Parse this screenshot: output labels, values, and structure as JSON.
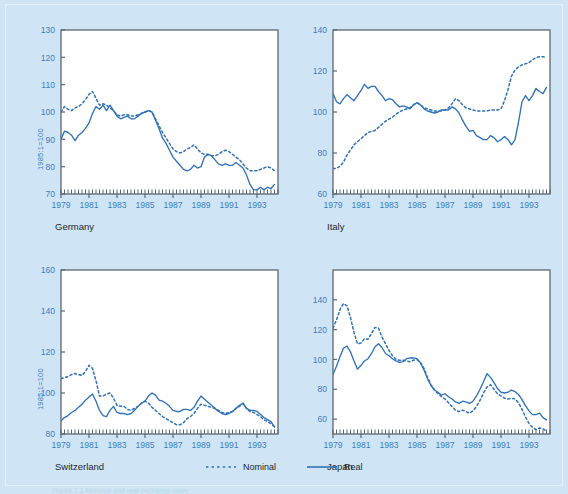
{
  "figure": {
    "background_color": "#cfe5f5",
    "axis_color": "#5b6770",
    "tick_label_color": "#3a7fc1",
    "series_color": "#2f72b8",
    "title_color": "#23272b",
    "caption": "Figure 7.1  Nominal and real exchange rates"
  },
  "legend": {
    "position": "bottom-center",
    "entries": [
      {
        "label": "Nominal",
        "style": "dotted"
      },
      {
        "label": "Real",
        "style": "solid"
      }
    ]
  },
  "chart_data": [
    {
      "type": "line",
      "title": "Germany",
      "xlabel": "",
      "ylabel": "1985:1=100",
      "xlim": [
        1979.0,
        1994.5
      ],
      "ylim": [
        70,
        130
      ],
      "yticks": [
        70,
        80,
        90,
        100,
        110,
        120,
        130
      ],
      "xticks": [
        1979,
        1981,
        1983,
        1985,
        1987,
        1989,
        1991,
        1993
      ],
      "grid": false,
      "x": [
        1979.0,
        1979.25,
        1979.5,
        1979.75,
        1980.0,
        1980.25,
        1980.5,
        1980.75,
        1981.0,
        1981.25,
        1981.5,
        1981.75,
        1982.0,
        1982.25,
        1982.5,
        1982.75,
        1983.0,
        1983.25,
        1983.5,
        1983.75,
        1984.0,
        1984.25,
        1984.5,
        1984.75,
        1985.0,
        1985.25,
        1985.5,
        1985.75,
        1986.0,
        1986.25,
        1986.5,
        1986.75,
        1987.0,
        1987.25,
        1987.5,
        1987.75,
        1988.0,
        1988.25,
        1988.5,
        1988.75,
        1989.0,
        1989.25,
        1989.5,
        1989.75,
        1990.0,
        1990.25,
        1990.5,
        1990.75,
        1991.0,
        1991.25,
        1991.5,
        1991.75,
        1992.0,
        1992.25,
        1992.5,
        1992.75,
        1993.0,
        1993.25,
        1993.5,
        1993.75,
        1994.0,
        1994.25
      ],
      "series": [
        {
          "name": "Nominal",
          "style": "dotted",
          "values": [
            100.0,
            102.0,
            101.0,
            100.5,
            101.5,
            102.0,
            103.0,
            104.5,
            106.5,
            107.5,
            105.0,
            102.5,
            103.0,
            102.5,
            101.5,
            100.5,
            99.0,
            98.5,
            99.0,
            99.0,
            98.5,
            98.5,
            99.0,
            99.5,
            100.0,
            100.5,
            100.0,
            97.5,
            95.0,
            92.5,
            90.5,
            88.5,
            86.5,
            85.5,
            85.0,
            85.5,
            86.5,
            87.0,
            88.0,
            86.5,
            85.0,
            84.5,
            84.5,
            84.0,
            84.0,
            84.5,
            85.5,
            86.0,
            85.5,
            84.5,
            83.5,
            82.5,
            81.0,
            79.5,
            78.5,
            78.5,
            78.5,
            79.0,
            79.5,
            80.0,
            79.5,
            78.5
          ]
        },
        {
          "name": "Real",
          "style": "solid",
          "values": [
            90.0,
            93.0,
            92.5,
            91.5,
            89.5,
            91.5,
            92.5,
            94.0,
            96.0,
            99.5,
            102.0,
            101.0,
            102.5,
            100.5,
            102.5,
            100.5,
            98.5,
            97.5,
            98.0,
            98.5,
            97.5,
            97.5,
            98.5,
            99.5,
            100.0,
            100.5,
            100.0,
            97.0,
            94.0,
            90.5,
            88.5,
            86.0,
            83.5,
            82.0,
            80.5,
            79.0,
            78.5,
            79.0,
            80.5,
            79.5,
            80.0,
            83.5,
            84.5,
            84.0,
            82.5,
            81.0,
            80.5,
            81.0,
            80.5,
            80.5,
            81.5,
            80.5,
            79.5,
            77.0,
            73.5,
            71.5,
            71.5,
            72.5,
            71.5,
            72.5,
            72.0,
            73.5
          ]
        }
      ]
    },
    {
      "type": "line",
      "title": "Italy",
      "xlabel": "",
      "ylabel": "",
      "xlim": [
        1979.0,
        1994.5
      ],
      "ylim": [
        60,
        140
      ],
      "yticks": [
        60,
        80,
        100,
        120,
        140
      ],
      "xticks": [
        1979,
        1981,
        1983,
        1985,
        1987,
        1989,
        1991,
        1993
      ],
      "grid": false,
      "x": [
        1979.0,
        1979.25,
        1979.5,
        1979.75,
        1980.0,
        1980.25,
        1980.5,
        1980.75,
        1981.0,
        1981.25,
        1981.5,
        1981.75,
        1982.0,
        1982.25,
        1982.5,
        1982.75,
        1983.0,
        1983.25,
        1983.5,
        1983.75,
        1984.0,
        1984.25,
        1984.5,
        1984.75,
        1985.0,
        1985.25,
        1985.5,
        1985.75,
        1986.0,
        1986.25,
        1986.5,
        1986.75,
        1987.0,
        1987.25,
        1987.5,
        1987.75,
        1988.0,
        1988.25,
        1988.5,
        1988.75,
        1989.0,
        1989.25,
        1989.5,
        1989.75,
        1990.0,
        1990.25,
        1990.5,
        1990.75,
        1991.0,
        1991.25,
        1991.5,
        1991.75,
        1992.0,
        1992.25,
        1992.5,
        1992.75,
        1993.0,
        1993.25,
        1993.5,
        1993.75,
        1994.0,
        1994.25
      ],
      "series": [
        {
          "name": "Nominal",
          "style": "dotted",
          "values": [
            72.5,
            72.5,
            73.5,
            75.5,
            79.0,
            81.5,
            84.0,
            85.5,
            87.0,
            88.5,
            90.0,
            90.5,
            91.0,
            92.5,
            94.0,
            95.5,
            96.5,
            97.5,
            99.0,
            100.0,
            101.0,
            101.5,
            102.0,
            103.5,
            104.5,
            103.5,
            102.0,
            101.5,
            101.0,
            100.5,
            100.5,
            100.5,
            101.0,
            102.0,
            104.0,
            106.5,
            105.5,
            103.5,
            102.0,
            101.5,
            101.0,
            100.5,
            100.5,
            100.5,
            100.5,
            101.0,
            101.0,
            101.0,
            101.5,
            105.5,
            111.0,
            117.5,
            120.5,
            122.0,
            123.0,
            123.5,
            124.0,
            125.5,
            126.5,
            127.0,
            127.0,
            126.5
          ]
        },
        {
          "name": "Real",
          "style": "solid",
          "values": [
            109.0,
            105.0,
            104.0,
            106.5,
            108.5,
            107.0,
            105.5,
            108.0,
            110.5,
            113.5,
            111.5,
            112.5,
            112.5,
            110.0,
            108.0,
            105.5,
            106.5,
            106.0,
            104.0,
            102.5,
            103.0,
            102.5,
            101.5,
            103.5,
            104.5,
            103.5,
            101.5,
            100.5,
            100.0,
            99.5,
            100.0,
            101.0,
            101.0,
            101.0,
            102.5,
            101.5,
            99.5,
            96.0,
            93.0,
            90.5,
            91.0,
            88.5,
            87.5,
            86.5,
            86.5,
            88.5,
            87.5,
            85.5,
            86.5,
            88.0,
            86.5,
            84.0,
            86.5,
            95.0,
            105.0,
            108.0,
            105.5,
            108.0,
            111.5,
            110.0,
            109.0,
            112.0
          ]
        }
      ]
    },
    {
      "type": "line",
      "title": "Switzerland",
      "xlabel": "",
      "ylabel": "1985:1=100",
      "xlim": [
        1979.0,
        1994.5
      ],
      "ylim": [
        80,
        160
      ],
      "yticks": [
        80,
        100,
        120,
        140,
        160
      ],
      "xticks": [
        1979,
        1981,
        1983,
        1985,
        1987,
        1989,
        1991,
        1993
      ],
      "grid": false,
      "x": [
        1979.0,
        1979.25,
        1979.5,
        1979.75,
        1980.0,
        1980.25,
        1980.5,
        1980.75,
        1981.0,
        1981.25,
        1981.5,
        1981.75,
        1982.0,
        1982.25,
        1982.5,
        1982.75,
        1983.0,
        1983.25,
        1983.5,
        1983.75,
        1984.0,
        1984.25,
        1984.5,
        1984.75,
        1985.0,
        1985.25,
        1985.5,
        1985.75,
        1986.0,
        1986.25,
        1986.5,
        1986.75,
        1987.0,
        1987.25,
        1987.5,
        1987.75,
        1988.0,
        1988.25,
        1988.5,
        1988.75,
        1989.0,
        1989.25,
        1989.5,
        1989.75,
        1990.0,
        1990.25,
        1990.5,
        1990.75,
        1991.0,
        1991.25,
        1991.5,
        1991.75,
        1992.0,
        1992.25,
        1992.5,
        1992.75,
        1993.0,
        1993.25,
        1993.5,
        1993.75,
        1994.0,
        1994.25
      ],
      "series": [
        {
          "name": "Nominal",
          "style": "dotted",
          "values": [
            107.0,
            107.5,
            108.0,
            109.0,
            109.5,
            109.0,
            108.5,
            110.5,
            113.5,
            112.0,
            106.0,
            98.5,
            98.5,
            99.5,
            100.0,
            97.5,
            94.0,
            93.5,
            93.5,
            92.0,
            91.5,
            92.5,
            93.5,
            95.0,
            96.0,
            95.0,
            93.0,
            91.5,
            90.0,
            88.5,
            87.5,
            86.5,
            85.5,
            84.5,
            84.5,
            85.5,
            87.5,
            88.5,
            90.0,
            92.5,
            94.5,
            94.0,
            93.5,
            93.0,
            92.5,
            91.5,
            90.5,
            90.0,
            90.5,
            91.0,
            92.5,
            93.5,
            95.0,
            92.5,
            91.0,
            90.5,
            89.5,
            88.5,
            87.0,
            86.0,
            85.0,
            83.5
          ]
        },
        {
          "name": "Real",
          "style": "solid",
          "values": [
            86.5,
            88.0,
            89.0,
            90.5,
            91.5,
            93.0,
            94.5,
            96.5,
            98.0,
            99.5,
            96.0,
            91.5,
            89.0,
            88.5,
            91.5,
            93.5,
            90.5,
            90.0,
            90.0,
            89.5,
            90.0,
            91.5,
            93.5,
            95.0,
            96.0,
            98.5,
            100.0,
            99.0,
            96.5,
            96.0,
            95.0,
            93.5,
            91.5,
            91.0,
            91.0,
            92.0,
            92.0,
            91.5,
            93.0,
            96.0,
            98.5,
            97.0,
            95.5,
            94.0,
            92.5,
            91.0,
            90.0,
            89.5,
            90.0,
            91.0,
            92.5,
            94.0,
            95.0,
            92.5,
            91.5,
            91.5,
            91.0,
            89.5,
            88.0,
            87.0,
            86.0,
            83.5
          ]
        }
      ]
    },
    {
      "type": "line",
      "title": "Japan",
      "xlabel": "",
      "ylabel": "",
      "xlim": [
        1979.0,
        1994.5
      ],
      "ylim": [
        50,
        160
      ],
      "yticks": [
        60,
        80,
        100,
        120,
        140
      ],
      "xticks": [
        1979,
        1981,
        1983,
        1985,
        1987,
        1989,
        1991,
        1993
      ],
      "grid": false,
      "x": [
        1979.0,
        1979.25,
        1979.5,
        1979.75,
        1980.0,
        1980.25,
        1980.5,
        1980.75,
        1981.0,
        1981.25,
        1981.5,
        1981.75,
        1982.0,
        1982.25,
        1982.5,
        1982.75,
        1983.0,
        1983.25,
        1983.5,
        1983.75,
        1984.0,
        1984.25,
        1984.5,
        1984.75,
        1985.0,
        1985.25,
        1985.5,
        1985.75,
        1986.0,
        1986.25,
        1986.5,
        1986.75,
        1987.0,
        1987.25,
        1987.5,
        1987.75,
        1988.0,
        1988.25,
        1988.5,
        1988.75,
        1989.0,
        1989.25,
        1989.5,
        1989.75,
        1990.0,
        1990.25,
        1990.5,
        1990.75,
        1991.0,
        1991.25,
        1991.5,
        1991.75,
        1992.0,
        1992.25,
        1992.5,
        1992.75,
        1993.0,
        1993.25,
        1993.5,
        1993.75,
        1994.0,
        1994.25
      ],
      "series": [
        {
          "name": "Nominal",
          "style": "dotted",
          "values": [
            121.0,
            126.5,
            133.5,
            137.5,
            136.0,
            128.0,
            118.0,
            110.5,
            111.0,
            114.0,
            113.5,
            117.5,
            121.5,
            121.0,
            115.0,
            110.5,
            106.0,
            102.5,
            100.0,
            99.5,
            99.5,
            99.0,
            98.5,
            99.5,
            100.0,
            98.0,
            94.0,
            88.0,
            83.0,
            79.5,
            77.0,
            75.0,
            73.5,
            71.0,
            68.5,
            66.0,
            65.0,
            66.0,
            65.0,
            64.0,
            65.5,
            68.5,
            72.5,
            77.5,
            81.5,
            83.0,
            80.0,
            77.0,
            75.5,
            74.0,
            73.5,
            74.0,
            73.5,
            71.0,
            66.5,
            61.5,
            57.0,
            54.5,
            53.0,
            54.0,
            53.5,
            52.0
          ]
        },
        {
          "name": "Real",
          "style": "solid",
          "values": [
            90.0,
            95.5,
            102.0,
            107.5,
            109.0,
            105.0,
            99.0,
            93.5,
            96.0,
            99.0,
            100.5,
            104.0,
            108.5,
            110.5,
            108.0,
            104.0,
            102.5,
            100.5,
            99.0,
            98.0,
            98.5,
            100.5,
            101.0,
            101.0,
            100.5,
            97.5,
            93.0,
            87.0,
            82.5,
            79.5,
            78.0,
            76.0,
            77.0,
            75.0,
            73.5,
            71.5,
            70.5,
            72.0,
            71.5,
            70.5,
            72.0,
            75.5,
            80.0,
            85.0,
            90.5,
            88.0,
            84.5,
            80.5,
            78.0,
            77.5,
            78.0,
            79.5,
            78.5,
            76.5,
            73.0,
            69.0,
            65.5,
            63.0,
            63.0,
            64.0,
            61.0,
            59.5
          ]
        }
      ]
    }
  ]
}
